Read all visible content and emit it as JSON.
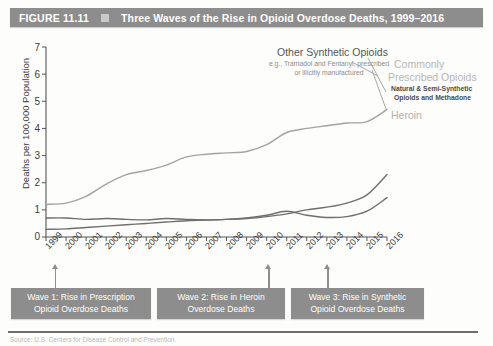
{
  "header": {
    "figure_number": "FIGURE 11.11",
    "marker_icon": "square-marker",
    "title": "Three Waves of the Rise in Opioid Overdose Deaths, 1999–2016",
    "bar_color": "#8d8d8d",
    "text_color": "#ffffff"
  },
  "annotations": {
    "synthetic_title": "Other Synthetic Opioids",
    "synthetic_sub_line1": "e.g., Tramadol and Fentanyl, prescribed",
    "synthetic_sub_line2": "or illicitly manufactured",
    "commonly_line1": "Commonly",
    "commonly_line2": "Prescribed Opioids",
    "commonly_sub_line1": "Natural & Semi-Synthetic",
    "commonly_sub_line2": "Opioids and Methadone",
    "heroin_label": "Heroin"
  },
  "waves": [
    {
      "line1": "Wave 1: Rise in Prescription",
      "line2": "Opioid Overdose Deaths",
      "points_to_year": "2000"
    },
    {
      "line1": "Wave 2: Rise in Heroin",
      "line2": "Overdose Deaths",
      "points_to_year": "2010"
    },
    {
      "line1": "Wave 3: Rise in Synthetic",
      "line2": "Opioid Overdose Deaths",
      "points_to_year": "2013"
    }
  ],
  "source_note": "Source: U.S. Centers for Disease Control and Prevention.",
  "chart_data": {
    "type": "line",
    "title": "Three Waves of the Rise in Opioid Overdose Deaths, 1999–2016",
    "xlabel": "",
    "ylabel": "Deaths per 100,000 Population",
    "x": [
      1999,
      2000,
      2001,
      2002,
      2003,
      2004,
      2005,
      2006,
      2007,
      2008,
      2009,
      2010,
      2011,
      2012,
      2013,
      2014,
      2015,
      2016
    ],
    "xlim": [
      1999,
      2016
    ],
    "ylim": [
      0,
      7
    ],
    "yticks": [
      0,
      1,
      2,
      3,
      4,
      5,
      6,
      7
    ],
    "xtick_labels": [
      "1999",
      "2000",
      "2001",
      "2002",
      "2003",
      "2004",
      "2005",
      "2006",
      "2007",
      "2008",
      "2009",
      "2010",
      "2011",
      "2012",
      "2013",
      "2014",
      "2015",
      "2016"
    ],
    "grid": false,
    "legend_position": "inline-annotations",
    "series": [
      {
        "name": "Commonly Prescribed Opioids (Natural & Semi-Synthetic Opioids and Methadone)",
        "color": "#a3a3a3",
        "values": [
          1.2,
          1.25,
          1.5,
          1.95,
          2.3,
          2.45,
          2.65,
          2.95,
          3.05,
          3.1,
          3.15,
          3.4,
          3.85,
          4.0,
          4.1,
          4.2,
          4.25,
          4.7
        ]
      },
      {
        "name": "Heroin",
        "color": "#6e6e6e",
        "values": [
          0.7,
          0.7,
          0.65,
          0.68,
          0.65,
          0.63,
          0.68,
          0.65,
          0.63,
          0.65,
          0.7,
          0.8,
          0.95,
          0.8,
          0.72,
          0.75,
          0.95,
          1.45
        ]
      },
      {
        "name": "Other Synthetic Opioids",
        "color": "#6e6e6e",
        "values": [
          0.28,
          0.3,
          0.35,
          0.4,
          0.45,
          0.5,
          0.55,
          0.6,
          0.62,
          0.65,
          0.68,
          0.75,
          0.85,
          1.0,
          1.1,
          1.25,
          1.55,
          2.3
        ]
      }
    ]
  }
}
